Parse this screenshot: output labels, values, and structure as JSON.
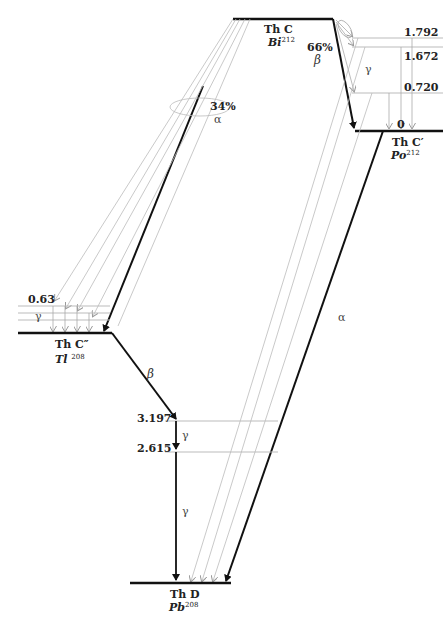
{
  "nuclides": {
    "thc": {
      "name": "Th C",
      "symbol": "Bi",
      "mass": "212"
    },
    "thc_prime": {
      "name": "Th C′",
      "symbol": "Po",
      "mass": "212"
    },
    "thc_dprime": {
      "name": "Th C″",
      "symbol": "Tl",
      "mass": "208"
    },
    "thd": {
      "name": "Th D",
      "symbol": "Pb",
      "mass": "208"
    }
  },
  "branches": {
    "beta_branch": {
      "percent": "66%",
      "symbol": "β"
    },
    "alpha_branch": {
      "percent": "34%",
      "symbol": "α"
    }
  },
  "levels": {
    "thc_prime": [
      "1.792",
      "1.672",
      "0.720",
      "0"
    ],
    "thc_dprime": [
      "0.63"
    ],
    "thd": [
      "3.197",
      "2.615"
    ]
  },
  "transition_labels": {
    "gamma": "γ",
    "alpha": "α",
    "beta": "β"
  },
  "colors": {
    "main_line": "#111111",
    "thin_line": "#b0b0b0"
  }
}
